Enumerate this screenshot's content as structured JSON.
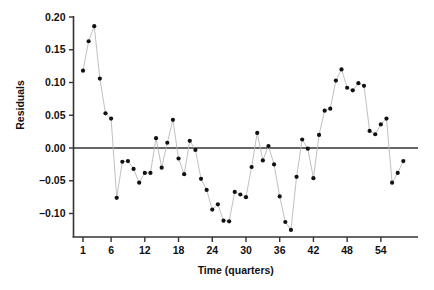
{
  "chart_data": {
    "type": "scatter",
    "title": "",
    "subtitle": "",
    "xlabel": "Time (quarters)",
    "ylabel": "Residuals",
    "grid": false,
    "legend": "none",
    "marker": "filled-circle",
    "line_style": "thin-connecting-line",
    "marker_color": "#111111",
    "line_color": "#b9b9b9",
    "axis_color": "#333333",
    "zero_line": 0.0,
    "xlim": [
      0,
      59
    ],
    "ylim": [
      -0.14,
      0.205
    ],
    "xticks": [
      1,
      6,
      12,
      18,
      24,
      30,
      36,
      42,
      48,
      54
    ],
    "xtick_labels": [
      "1",
      "6",
      "12",
      "18",
      "24",
      "30",
      "36",
      "42",
      "48",
      "54"
    ],
    "yticks": [
      -0.1,
      -0.05,
      0.0,
      0.05,
      0.1,
      0.15,
      0.2
    ],
    "ytick_labels": [
      "–0.10",
      "–0.05",
      "0.00",
      "0.05",
      "0.10",
      "0.15",
      "0.20"
    ],
    "x": [
      1,
      2,
      3,
      4,
      5,
      6,
      7,
      8,
      9,
      10,
      11,
      12,
      13,
      14,
      15,
      16,
      17,
      18,
      19,
      20,
      21,
      22,
      23,
      24,
      25,
      26,
      27,
      28,
      29,
      30,
      31,
      32,
      33,
      34,
      35,
      36,
      37,
      38,
      39,
      40,
      41,
      42,
      43,
      44,
      45,
      46,
      47,
      48,
      49,
      50,
      51,
      52,
      53,
      54,
      55,
      56,
      57,
      58
    ],
    "values": [
      0.118,
      0.163,
      0.186,
      0.106,
      0.053,
      0.045,
      -0.076,
      -0.021,
      -0.02,
      -0.032,
      -0.053,
      -0.038,
      -0.038,
      0.015,
      -0.03,
      0.008,
      0.043,
      -0.016,
      -0.04,
      0.011,
      -0.003,
      -0.047,
      -0.064,
      -0.094,
      -0.086,
      -0.111,
      -0.112,
      -0.067,
      -0.071,
      -0.075,
      -0.029,
      0.023,
      -0.019,
      0.003,
      -0.025,
      -0.074,
      -0.113,
      -0.125,
      -0.044,
      0.013,
      -0.001,
      -0.046,
      0.02,
      0.057,
      0.06,
      0.103,
      0.12,
      0.092,
      0.088,
      0.099,
      0.095,
      0.026,
      0.021,
      0.036,
      0.045,
      -0.053,
      -0.038,
      -0.02
    ],
    "series": [
      {
        "name": "Residuals",
        "values": [
          0.118,
          0.163,
          0.186,
          0.106,
          0.053,
          0.045,
          -0.076,
          -0.021,
          -0.02,
          -0.032,
          -0.053,
          -0.038,
          -0.038,
          0.015,
          -0.03,
          0.008,
          0.043,
          -0.016,
          -0.04,
          0.011,
          -0.003,
          -0.047,
          -0.064,
          -0.094,
          -0.086,
          -0.111,
          -0.112,
          -0.067,
          -0.071,
          -0.075,
          -0.029,
          0.023,
          -0.019,
          0.003,
          -0.025,
          -0.074,
          -0.113,
          -0.125,
          -0.044,
          0.013,
          -0.001,
          -0.046,
          0.02,
          0.057,
          0.06,
          0.103,
          0.12,
          0.092,
          0.088,
          0.099,
          0.095,
          0.026,
          0.021,
          0.036,
          0.045,
          -0.053,
          -0.038,
          -0.02
        ]
      }
    ]
  }
}
